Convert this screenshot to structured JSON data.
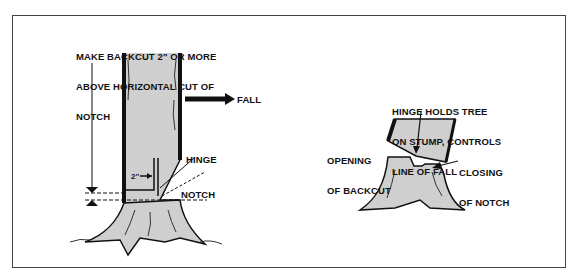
{
  "figure": {
    "left_panel": {
      "instruction": [
        "MAKE BACKCUT 2\" OR MORE",
        "ABOVE HORIZONTAL CUT OF",
        "NOTCH"
      ],
      "fall_label": "FALL",
      "hinge_label": "HINGE",
      "notch_label": "NOTCH",
      "measure_label": "2\""
    },
    "right_panel": {
      "hinge_note": [
        "HINGE HOLDS TREE",
        "ON STUMP, CONTROLS",
        "LINE OF FALL"
      ],
      "opening_label": [
        "OPENING",
        "OF BACKCUT"
      ],
      "closing_label": [
        "CLOSING",
        "OF NOTCH"
      ]
    },
    "colors": {
      "trunk_fill": "#cfcfcf",
      "ink": "#111111",
      "frame": "#444444"
    }
  }
}
